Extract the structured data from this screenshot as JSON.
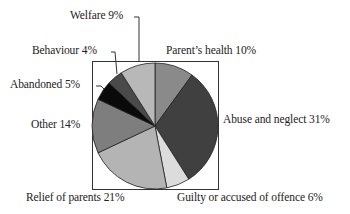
{
  "chart_data": {
    "type": "pie",
    "title": "",
    "start_angle_deg": 0,
    "direction": "clockwise",
    "slices": [
      {
        "label": "Parent's health",
        "value": 10,
        "display": "Parent’s health 10%",
        "color": "#8a8a8a"
      },
      {
        "label": "Abuse and neglect",
        "value": 31,
        "display": "Abuse and neglect 31%",
        "color": "#404040"
      },
      {
        "label": "Guilty or accused of offence",
        "value": 6,
        "display": "Guilty or accused of offence 6%",
        "color": "#dcdcdc"
      },
      {
        "label": "Relief of parents",
        "value": 21,
        "display": "Relief of parents 21%",
        "color": "#b4b4b4"
      },
      {
        "label": "Other",
        "value": 14,
        "display": "Other 14%",
        "color": "#7e7e7e"
      },
      {
        "label": "Abandoned",
        "value": 5,
        "display": "Abandoned 5%",
        "color": "#0a0a0a"
      },
      {
        "label": "Behaviour",
        "value": 4,
        "display": "Behaviour 4%",
        "color": "#4a4a4a"
      },
      {
        "label": "Welfare",
        "value": 9,
        "display": "Welfare 9%",
        "color": "#b8b8b8"
      }
    ],
    "frame": {
      "x": 92,
      "y": 61,
      "w": 126,
      "h": 128
    },
    "center": [
      155,
      126
    ],
    "radius": 63,
    "legend": "none (direct labels with leader lines)"
  }
}
